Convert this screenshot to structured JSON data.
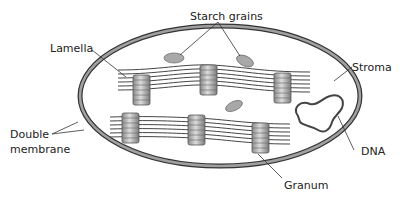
{
  "diagram": {
    "labels": {
      "starch_grains": "Starch grains",
      "lamella": "Lamella",
      "stroma": "Stroma",
      "double_membrane_line1": "Double",
      "double_membrane_line2": "membrane",
      "dna": "DNA",
      "granum": "Granum"
    },
    "colors": {
      "membrane_fill": "#9a9a9a",
      "membrane_stroke": "#333333",
      "granum_light": "#d8d8d8",
      "granum_dark": "#7a7a7a",
      "starch": "#a8a8a8",
      "line": "#444444"
    }
  }
}
